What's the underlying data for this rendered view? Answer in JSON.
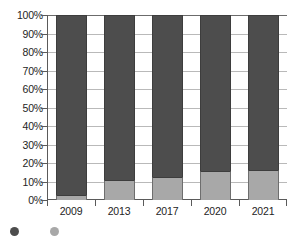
{
  "chart_data": {
    "type": "bar",
    "variant": "stacked-100-percent",
    "title": "",
    "subtitle": "",
    "xlabel": "",
    "ylabel": "",
    "categories": [
      "2009",
      "2013",
      "2017",
      "2020",
      "2021"
    ],
    "ylim": [
      0,
      100
    ],
    "ytick_labels": [
      "0%",
      "10%",
      "20%",
      "30%",
      "40%",
      "50%",
      "60%",
      "70%",
      "80%",
      "90%",
      "100%"
    ],
    "ytick_values": [
      0,
      10,
      20,
      30,
      40,
      50,
      60,
      70,
      80,
      90,
      100
    ],
    "grid": true,
    "grid_axis": "y",
    "legend_position": "bottom-left",
    "series": [
      {
        "name": "",
        "color": "#a8a8a8",
        "stack_order": 0,
        "values": [
          2.5,
          11,
          12.5,
          15.5,
          16
        ]
      },
      {
        "name": "",
        "color": "#4d4d4d",
        "stack_order": 1,
        "values": [
          97.5,
          89,
          87.5,
          84.5,
          84
        ]
      }
    ]
  },
  "legend": {
    "entries": [
      {
        "label": "",
        "color": "#4d4d4d"
      },
      {
        "label": "",
        "color": "#a8a8a8"
      }
    ]
  },
  "colors": {
    "series_light": "#a8a8a8",
    "series_dark": "#4d4d4d",
    "axis": "#5a5a5a",
    "grid": "#b9b9b9",
    "text": "#242424",
    "background": "#ffffff"
  }
}
